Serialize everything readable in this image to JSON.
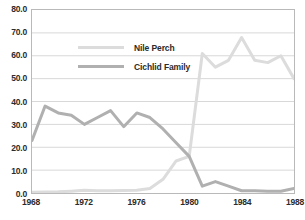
{
  "chart_data": {
    "type": "line",
    "title": "",
    "xlabel": "",
    "ylabel": "",
    "xlim": [
      1968,
      1988
    ],
    "ylim": [
      0,
      80
    ],
    "grid": true,
    "legend_position": "inside-upper-left",
    "y_ticks": [
      "0.0",
      "10.0",
      "20.0",
      "30.0",
      "40.0",
      "50.0",
      "60.0",
      "70.0",
      "80.0"
    ],
    "y_tick_values": [
      0,
      10,
      20,
      30,
      40,
      50,
      60,
      70,
      80
    ],
    "x_ticks": [
      "1968",
      "1972",
      "1976",
      "1980",
      "1984",
      "1988"
    ],
    "x_tick_values": [
      1968,
      1972,
      1976,
      1980,
      1984,
      1988
    ],
    "x": [
      1968,
      1969,
      1970,
      1971,
      1972,
      1973,
      1974,
      1975,
      1976,
      1977,
      1978,
      1979,
      1980,
      1981,
      1982,
      1983,
      1984,
      1985,
      1986,
      1987,
      1988
    ],
    "series": [
      {
        "name": "Nile Perch",
        "color": "#dcdcdc",
        "values": [
          0.3,
          0.4,
          0.5,
          0.8,
          1.2,
          1.0,
          1.0,
          1.1,
          1.2,
          2.0,
          6.0,
          14.0,
          16.0,
          61.0,
          55.0,
          58.0,
          68.0,
          58.0,
          57.0,
          60.0,
          50.0
        ]
      },
      {
        "name": "Cichlid Family",
        "color": "#b0b0b0",
        "values": [
          23.0,
          38.0,
          35.0,
          34.0,
          30.0,
          33.0,
          36.0,
          29.0,
          35.0,
          33.0,
          28.0,
          22.0,
          16.0,
          3.0,
          5.0,
          3.0,
          1.0,
          1.0,
          0.8,
          0.8,
          2.0
        ]
      }
    ]
  },
  "legend": {
    "entries": [
      {
        "label": "Nile Perch"
      },
      {
        "label": "Cichlid Family"
      }
    ]
  }
}
